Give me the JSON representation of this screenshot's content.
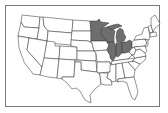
{
  "map": {
    "title": "United States map with highlighted Midwest states",
    "highlight_color": "#6e6e6e",
    "base_color": "#ffffff",
    "border_color": "#7a7a7a",
    "highlighted_states": [
      "Minnesota",
      "Wisconsin",
      "Michigan",
      "Illinois",
      "Indiana",
      "Ohio"
    ]
  }
}
